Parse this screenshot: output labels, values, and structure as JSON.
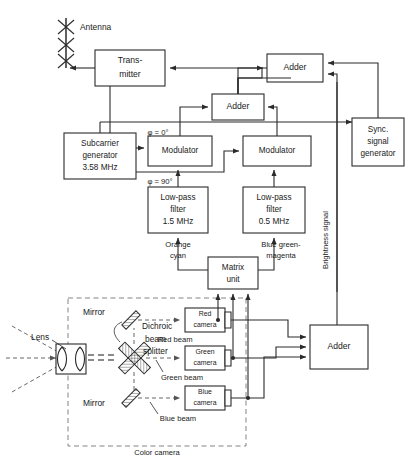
{
  "diagram": {
    "antenna": {
      "label": "Antenna"
    },
    "blocks": {
      "transmitter": {
        "line1": "Trans-",
        "line2": "mitter"
      },
      "adder_top": {
        "label": "Adder"
      },
      "adder_mid": {
        "label": "Adder"
      },
      "adder_bottom": {
        "label": "Adder"
      },
      "sync_generator": {
        "line1": "Sync.",
        "line2": "signal",
        "line3": "generator"
      },
      "subcarrier_generator": {
        "line1": "Subcarrier",
        "line2": "generator",
        "line3": "3.58 MHz"
      },
      "modulator_left": {
        "label": "Modulator"
      },
      "modulator_right": {
        "label": "Modulator"
      },
      "lpf_left": {
        "line1": "Low-pass",
        "line2": "filter",
        "line3": "1.5 MHz"
      },
      "lpf_right": {
        "line1": "Low-pass",
        "line2": "filter",
        "line3": "0.5 MHz"
      },
      "matrix_unit": {
        "line1": "Matrix",
        "line2": "unit"
      },
      "red_camera": {
        "line1": "Red",
        "line2": "camera"
      },
      "green_camera": {
        "line1": "Green",
        "line2": "camera"
      },
      "blue_camera": {
        "line1": "Blue",
        "line2": "camera"
      }
    },
    "labels": {
      "phase_zero": "φ = 0°",
      "phase_ninety": "φ = 90°",
      "orange_cyan_1": "Orange",
      "orange_cyan_2": "cyan",
      "blue_green_magenta_1": "Blue green-",
      "blue_green_magenta_2": "magenta",
      "brightness_signal": "Brightness signal",
      "lens": "Lens",
      "mirror_top": "Mirror",
      "mirror_bottom": "Mirror",
      "dichroic_1": "Dichroic",
      "dichroic_2": "beam",
      "dichroic_3": "splitter",
      "red_beam": "Red beam",
      "green_beam": "Green beam",
      "blue_beam": "Blue beam",
      "color_camera": "Color camera"
    },
    "colors": {
      "stroke": "#2b2b2b",
      "dashed": "#777777",
      "background": "#ffffff"
    }
  }
}
